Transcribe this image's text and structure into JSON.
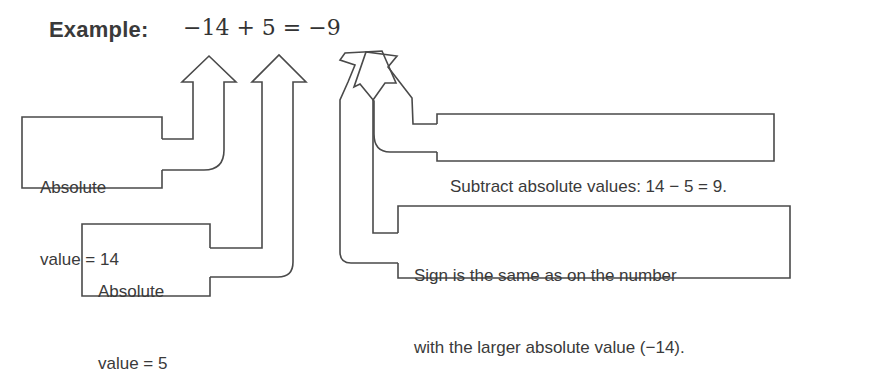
{
  "title": "Example:",
  "equation": "−14 + 5 = −9",
  "equation_parts": {
    "term1": "−14",
    "op": "+",
    "term2": "5",
    "equals": "=",
    "result": "−9"
  },
  "callouts": [
    {
      "id": "abs14",
      "lines": [
        "Absolute",
        "value = 14"
      ],
      "points_to": "−14"
    },
    {
      "id": "abs5",
      "lines": [
        "Absolute",
        "value = 5"
      ],
      "points_to": "5"
    },
    {
      "id": "subtract",
      "lines": [
        "Subtract absolute values: 14 − 5 = 9."
      ],
      "points_to": "9"
    },
    {
      "id": "sign",
      "lines": [
        "Sign is the same as on the number",
        "with the larger absolute value (−14)."
      ],
      "points_to": "− sign of −9"
    }
  ],
  "colors": {
    "stroke": "#4a4a4a",
    "text": "#3a3a3a",
    "background": "#ffffff"
  }
}
